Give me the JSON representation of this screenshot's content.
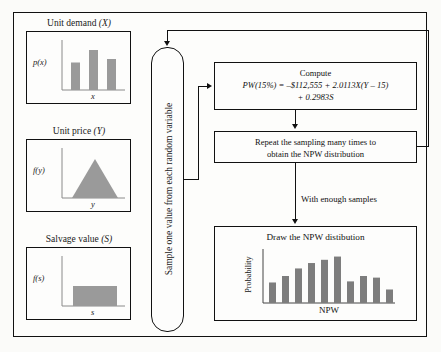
{
  "diagram": {
    "colors": {
      "bar_fill": "#9a9a9a",
      "stroke": "#111111",
      "background": "#fdfdfb"
    }
  },
  "inputs": [
    {
      "name": "unit-demand",
      "label": "Unit demand",
      "variable": "(X)",
      "y_axis": "p(x)",
      "x_axis": "x",
      "dist": "discrete"
    },
    {
      "name": "unit-price",
      "label": "Unit price",
      "variable": "(Y)",
      "y_axis": "f(y)",
      "x_axis": "y",
      "dist": "triangular"
    },
    {
      "name": "salvage-value",
      "label": "Salvage value",
      "variable": "(S)",
      "y_axis": "f(s)",
      "x_axis": "s",
      "dist": "uniform"
    }
  ],
  "sampler": {
    "text": "Sample one value from each random variable"
  },
  "compute": {
    "heading": "Compute",
    "equation_line1": "PW(15%) = –$112,555 + 2.0113X(Y – 15)",
    "equation_line2": "+ 0.2983S"
  },
  "repeat": {
    "line1": "Repeat the sampling many times to",
    "line2": "obtain the NPW distribution"
  },
  "enough_samples_note": "With enough samples",
  "chart_data": {
    "type": "bar",
    "title": "Draw the NPW distibution",
    "xlabel": "NPW",
    "ylabel": "Probability",
    "categories": [
      "1",
      "2",
      "3",
      "4",
      "5",
      "6",
      "7",
      "8",
      "9",
      "10"
    ],
    "values": [
      38,
      50,
      64,
      74,
      80,
      86,
      40,
      50,
      47,
      25
    ],
    "ylim": [
      0,
      100
    ],
    "grid": false,
    "legend": null
  },
  "mini_charts": {
    "unit_demand": {
      "type": "bar",
      "values": [
        55,
        80,
        62
      ],
      "ylim": [
        0,
        100
      ]
    },
    "unit_price": {
      "type": "area",
      "shape": "triangle"
    },
    "salvage_value": {
      "type": "area",
      "shape": "rectangle"
    }
  }
}
